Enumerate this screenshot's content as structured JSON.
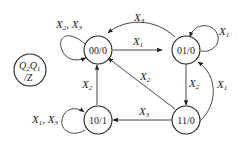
{
  "diagram": {
    "type": "state-transition-diagram",
    "legend": {
      "line1_a": "Q",
      "line1_a_sub": "2",
      "line1_b": "Q",
      "line1_b_sub": "1",
      "line2": "/Z"
    },
    "states": [
      {
        "id": "s00",
        "label": "00/0"
      },
      {
        "id": "s01",
        "label": "01/0"
      },
      {
        "id": "s10",
        "label": "10/1"
      },
      {
        "id": "s11",
        "label": "11/0"
      }
    ],
    "transitions": [
      {
        "from": "00/0",
        "to": "00/0",
        "label": "X2, X3"
      },
      {
        "from": "00/0",
        "to": "01/0",
        "label": "X1"
      },
      {
        "from": "01/0",
        "to": "00/0",
        "label": "X3"
      },
      {
        "from": "01/0",
        "to": "01/0",
        "label": "X1"
      },
      {
        "from": "01/0",
        "to": "11/0",
        "label": "X2"
      },
      {
        "from": "11/0",
        "to": "01/0",
        "label": "X1"
      },
      {
        "from": "11/0",
        "to": "00/0",
        "label": "X2"
      },
      {
        "from": "11/0",
        "to": "10/1",
        "label": "X3"
      },
      {
        "from": "10/1",
        "to": "00/0",
        "label": "X2"
      },
      {
        "from": "10/1",
        "to": "10/1",
        "label": "X1, X3"
      }
    ],
    "edge_labels": {
      "loop00_a": "X",
      "loop00_a_sub": "2",
      "loop00_b": "X",
      "loop00_b_sub": "3",
      "e00_01": "X",
      "e00_01_sub": "1",
      "e01_00": "X",
      "e01_00_sub": "3",
      "loop01": "X",
      "loop01_sub": "1",
      "e01_11": "X",
      "e01_11_sub": "2",
      "e11_01": "X",
      "e11_01_sub": "1",
      "e11_00": "X",
      "e11_00_sub": "2",
      "e11_10": "X",
      "e11_10_sub": "3",
      "e10_00": "X",
      "e10_00_sub": "2",
      "loop10_a": "X",
      "loop10_a_sub": "1",
      "loop10_b": "X",
      "loop10_b_sub": "3"
    }
  }
}
